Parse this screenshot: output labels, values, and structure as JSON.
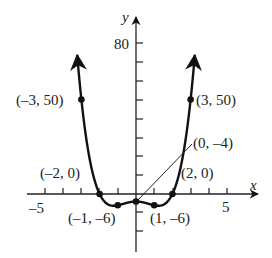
{
  "chart_data": {
    "type": "line",
    "title": "",
    "xlabel": "x",
    "ylabel": "y",
    "function": "y = x^4 - 3x^2 - 4",
    "xlim": [
      -5,
      5
    ],
    "ylim": [
      -20,
      80
    ],
    "x_ticks_every": 1,
    "y_ticks_every": 10,
    "tick_labels": {
      "x": [
        "-5",
        "5"
      ],
      "y": [
        "80"
      ]
    },
    "grid": false,
    "labeled_points": [
      {
        "x": -3,
        "y": 50,
        "label": "(–3, 50)"
      },
      {
        "x": 3,
        "y": 50,
        "label": "(3, 50)"
      },
      {
        "x": -2,
        "y": 0,
        "label": "(–2, 0)"
      },
      {
        "x": 2,
        "y": 0,
        "label": "(2, 0)"
      },
      {
        "x": -1,
        "y": -6,
        "label": "(–1, –6)"
      },
      {
        "x": 1,
        "y": -6,
        "label": "(1, –6)"
      },
      {
        "x": 0,
        "y": -4,
        "label": "(0, –4)"
      }
    ]
  },
  "labels": {
    "x_axis": "x",
    "y_axis": "y",
    "tick_neg5": "–5",
    "tick_5": "5",
    "tick_80": "80",
    "p_m3": "(–3, 50)",
    "p_3": "(3, 50)",
    "p_m2": "(–2, 0)",
    "p_2": "(2, 0)",
    "p_m1": "(–1, –6)",
    "p_1": "(1, –6)",
    "p_0": "(0, –4)"
  }
}
